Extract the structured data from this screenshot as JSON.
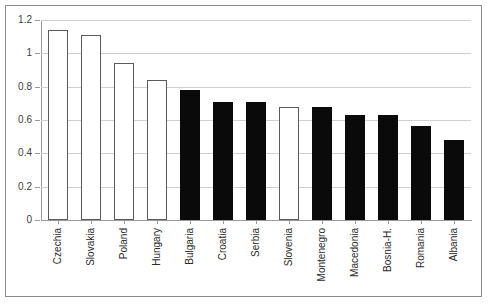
{
  "chart_data": {
    "type": "bar",
    "title": "",
    "subtitle": "",
    "xlabel": "",
    "ylabel": "",
    "ylim": [
      0,
      1.2
    ],
    "ytick_labels": [
      "0",
      "0.2",
      "0.4",
      "0.6",
      "0.8",
      "1",
      "1.2"
    ],
    "ytick_values": [
      0,
      0.2,
      0.4,
      0.6,
      0.8,
      1,
      1.2
    ],
    "ystep": 0.2,
    "grid": true,
    "legend": false,
    "legend_position": "none",
    "categories": [
      "Czechia",
      "Slovakia",
      "Poland",
      "Hungary",
      "Bulgaria",
      "Croatia",
      "Serbia",
      "Slovenia",
      "Montenegro",
      "Macedonia",
      "Bosnia-H.",
      "Romania",
      "Albania"
    ],
    "values": [
      1.14,
      1.11,
      0.94,
      0.84,
      0.78,
      0.71,
      0.705,
      0.68,
      0.68,
      0.63,
      0.63,
      0.565,
      0.48
    ],
    "bar_styles": [
      "open",
      "open",
      "open",
      "open",
      "filled",
      "filled",
      "filled",
      "open",
      "filled",
      "filled",
      "filled",
      "filled",
      "filled"
    ],
    "colors": {
      "filled": "#0a0a0a",
      "open_fill": "#ffffff",
      "open_stroke": "#5a5a5a",
      "gridline": "#d0d0d0",
      "axis": "#9a9a9a",
      "frame": "#8a8a8a",
      "text": "#2a2a2a"
    }
  }
}
